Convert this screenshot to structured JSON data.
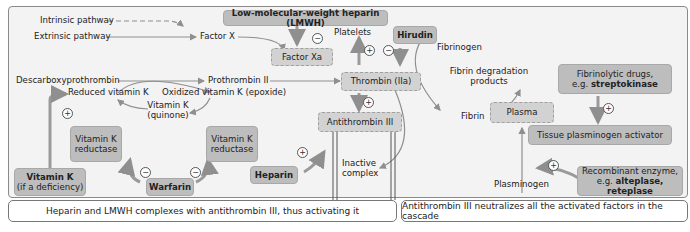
{
  "diagram": {
    "pathways": {
      "intrinsic": "Intrinsic pathway",
      "extrinsic": "Extrinsic pathway"
    },
    "factor_x": "Factor X",
    "lmwh": "Low-molecular-weight heparin (LMWH)",
    "factor_xa": "Factor Xa",
    "platelets": "Platelets",
    "hirudin": "Hirudin",
    "fibrinogen": "Fibrinogen",
    "descarboxyprothrombin": "Descarboxyprothrombin",
    "prothrombin": "Prothrombin II",
    "thrombin": "Thrombin (IIa)",
    "fibrin_degradation": "Fibrin degradation products",
    "fibrinolytic_drugs_prefix": "Fibrinolytic drugs,",
    "fibrinolytic_drugs_eg": "e.g. ",
    "fibrinolytic_drugs_example": "streptokinase",
    "reduced_vit_k": "Reduced vitamin K",
    "oxidized_vit_k": "Oxidized vitamin K (epoxide)",
    "vit_k_quinone_1": "Vitamin K",
    "vit_k_quinone_2": "(quinone)",
    "vit_k_reductase_left_1": "Vitamin K",
    "vit_k_reductase_left_2": "reductase",
    "vit_k_reductase_right_1": "Vitamin K",
    "vit_k_reductase_right_2": "reductase",
    "vitamin_k_supp": "Vitamin K",
    "vitamin_k_supp_note": "(if a deficiency)",
    "warfarin": "Warfarin",
    "antithrombin": "Antithrombin III",
    "heparin": "Heparin",
    "inactive_complex_1": "Inactive",
    "inactive_complex_2": "complex",
    "fibrin": "Fibrin",
    "plasma": "Plasma",
    "tpa": "Tissue plasminogen activator",
    "plasminogen": "Plasminogen",
    "recombinant_1": "Recombinant enzyme,",
    "recombinant_eg": "e.g. ",
    "recombinant_examples": "alteplase, reteplase",
    "signs": {
      "plus": "+",
      "minus": "−"
    }
  },
  "notes": {
    "left": "Heparin and LMWH complexes with antithrombin III, thus activating it",
    "right": "Antithrombin III neutralizes all the activated factors in the cascade"
  },
  "colors": {
    "drug_box": "#bdbdbd",
    "factor_box": "#d2d2d2",
    "arrow": "#8f8f8f",
    "background": "#f3f3f3"
  }
}
